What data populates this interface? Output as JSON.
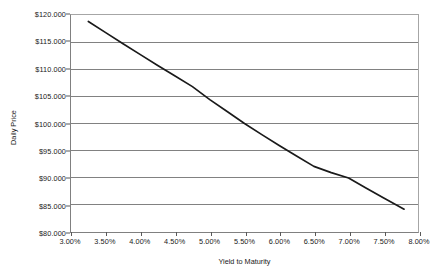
{
  "chart_data": {
    "type": "line",
    "title": "",
    "xlabel": "Yield to Maturity",
    "ylabel": "Daily Price",
    "xlim": [
      3.0,
      8.0
    ],
    "ylim": [
      80.0,
      120.0
    ],
    "grid": "horizontal",
    "legend": "none",
    "x_tick_labels": [
      "3.00%",
      "3.50%",
      "4.00%",
      "4.50%",
      "5.00%",
      "5.50%",
      "6.00%",
      "6.50%",
      "7.00%",
      "7.50%",
      "8.00%"
    ],
    "x_tick_values": [
      3.0,
      3.5,
      4.0,
      4.5,
      5.0,
      5.5,
      6.0,
      6.5,
      7.0,
      7.5,
      8.0
    ],
    "y_tick_labels": [
      "$120.000",
      "$115.000",
      "$110.000",
      "$105.000",
      "$100.000",
      "$95.000",
      "$90.000",
      "$85.000",
      "$80.000"
    ],
    "y_tick_values": [
      120.0,
      115.0,
      110.0,
      105.0,
      100.0,
      95.0,
      90.0,
      85.0,
      80.0
    ],
    "series": [
      {
        "name": "Daily Price",
        "color": "#1a1a1a",
        "x": [
          3.25,
          3.5,
          3.75,
          4.0,
          4.25,
          4.5,
          4.75,
          5.0,
          5.25,
          5.5,
          5.75,
          6.0,
          6.25,
          6.5,
          6.75,
          7.0,
          7.25,
          7.5,
          7.8
        ],
        "values": [
          118.8,
          116.75,
          114.7,
          112.7,
          110.7,
          108.75,
          106.8,
          104.4,
          102.2,
          100.0,
          97.95,
          95.95,
          94.0,
          92.1,
          90.95,
          89.95,
          88.1,
          86.3,
          84.2
        ]
      }
    ]
  },
  "axis_titles": {
    "x": "Yield to Maturity",
    "y": "Daily Price"
  }
}
